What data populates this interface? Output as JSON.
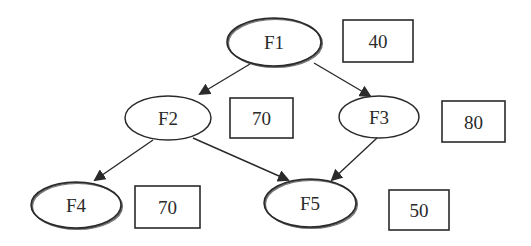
{
  "diagram": {
    "type": "weighted-directed-graph",
    "nodes": [
      {
        "id": "F1",
        "label": "F1",
        "value": "40",
        "double_outline": true,
        "cx": 274,
        "cy": 42,
        "rx": 47,
        "ry": 24,
        "box": {
          "x": 343,
          "y": 20,
          "w": 70,
          "h": 42
        }
      },
      {
        "id": "F2",
        "label": "F2",
        "value": "70",
        "double_outline": false,
        "cx": 168,
        "cy": 118,
        "rx": 43,
        "ry": 22,
        "box": {
          "x": 230,
          "y": 98,
          "w": 63,
          "h": 40
        }
      },
      {
        "id": "F3",
        "label": "F3",
        "value": "80",
        "double_outline": false,
        "cx": 379,
        "cy": 117,
        "rx": 40,
        "ry": 21,
        "box": {
          "x": 442,
          "y": 101,
          "w": 63,
          "h": 41
        }
      },
      {
        "id": "F4",
        "label": "F4",
        "value": "70",
        "double_outline": true,
        "cx": 76,
        "cy": 205,
        "rx": 45,
        "ry": 23,
        "box": {
          "x": 135,
          "y": 186,
          "w": 65,
          "h": 42
        }
      },
      {
        "id": "F5",
        "label": "F5",
        "value": "50",
        "double_outline": true,
        "cx": 310,
        "cy": 203,
        "rx": 46,
        "ry": 24,
        "box": {
          "x": 389,
          "y": 190,
          "w": 60,
          "h": 40
        }
      }
    ],
    "edges": [
      {
        "from": "F1",
        "to": "F2",
        "x1": 250,
        "y1": 64,
        "x2": 200,
        "y2": 94
      },
      {
        "from": "F1",
        "to": "F3",
        "x1": 314,
        "y1": 63,
        "x2": 370,
        "y2": 96
      },
      {
        "from": "F2",
        "to": "F4",
        "x1": 153,
        "y1": 140,
        "x2": 95,
        "y2": 180
      },
      {
        "from": "F2",
        "to": "F5",
        "x1": 193,
        "y1": 138,
        "x2": 288,
        "y2": 180
      },
      {
        "from": "F3",
        "to": "F5",
        "x1": 377,
        "y1": 138,
        "x2": 332,
        "y2": 180
      }
    ],
    "colors": {
      "stroke": "#2a2a2a",
      "fill": "#ffffff",
      "text": "#2a2a2a"
    }
  }
}
